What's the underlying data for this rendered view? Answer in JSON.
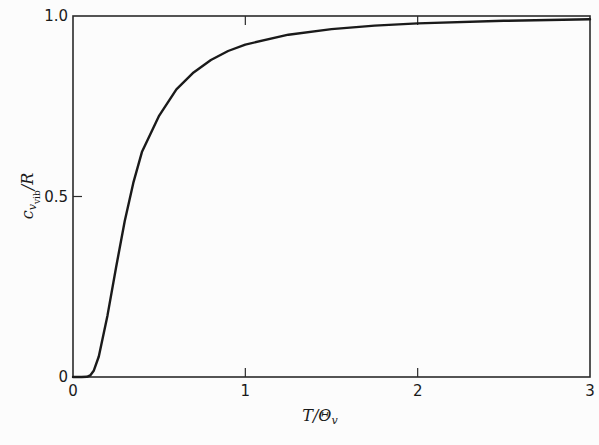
{
  "chart_data": {
    "type": "line",
    "title": "",
    "xlabel": "T/Θ_v",
    "ylabel": "c_{v_vib}/R",
    "xlim": [
      0,
      3
    ],
    "ylim": [
      0,
      1.0
    ],
    "grid": false,
    "legend": null,
    "x_ticks": [
      "0",
      "1",
      "2",
      "3"
    ],
    "y_ticks": [
      "0",
      "0.5",
      "1.0"
    ],
    "series": [
      {
        "name": "Einstein vibrational heat capacity",
        "x": [
          0.0,
          0.05,
          0.08,
          0.1,
          0.12,
          0.15,
          0.2,
          0.25,
          0.3,
          0.35,
          0.4,
          0.5,
          0.6,
          0.7,
          0.8,
          0.9,
          1.0,
          1.25,
          1.5,
          1.75,
          2.0,
          2.5,
          3.0
        ],
        "y": [
          0.0,
          0.0,
          0.0006,
          0.0045,
          0.0173,
          0.0568,
          0.1707,
          0.3041,
          0.4314,
          0.5376,
          0.6229,
          0.7241,
          0.797,
          0.8437,
          0.878,
          0.903,
          0.9207,
          0.9482,
          0.9637,
          0.9733,
          0.9794,
          0.9867,
          0.9908
        ]
      }
    ]
  },
  "axes": {
    "x_label_main": "T/Θ",
    "x_label_sub": "v",
    "y_label_main": "c",
    "y_label_sub": "v",
    "y_label_subsub": "vib",
    "y_label_tail": "/R"
  },
  "colors": {
    "line": "#1a1a1a",
    "frame": "#2a2a2a",
    "background": "#fcfcfc"
  }
}
